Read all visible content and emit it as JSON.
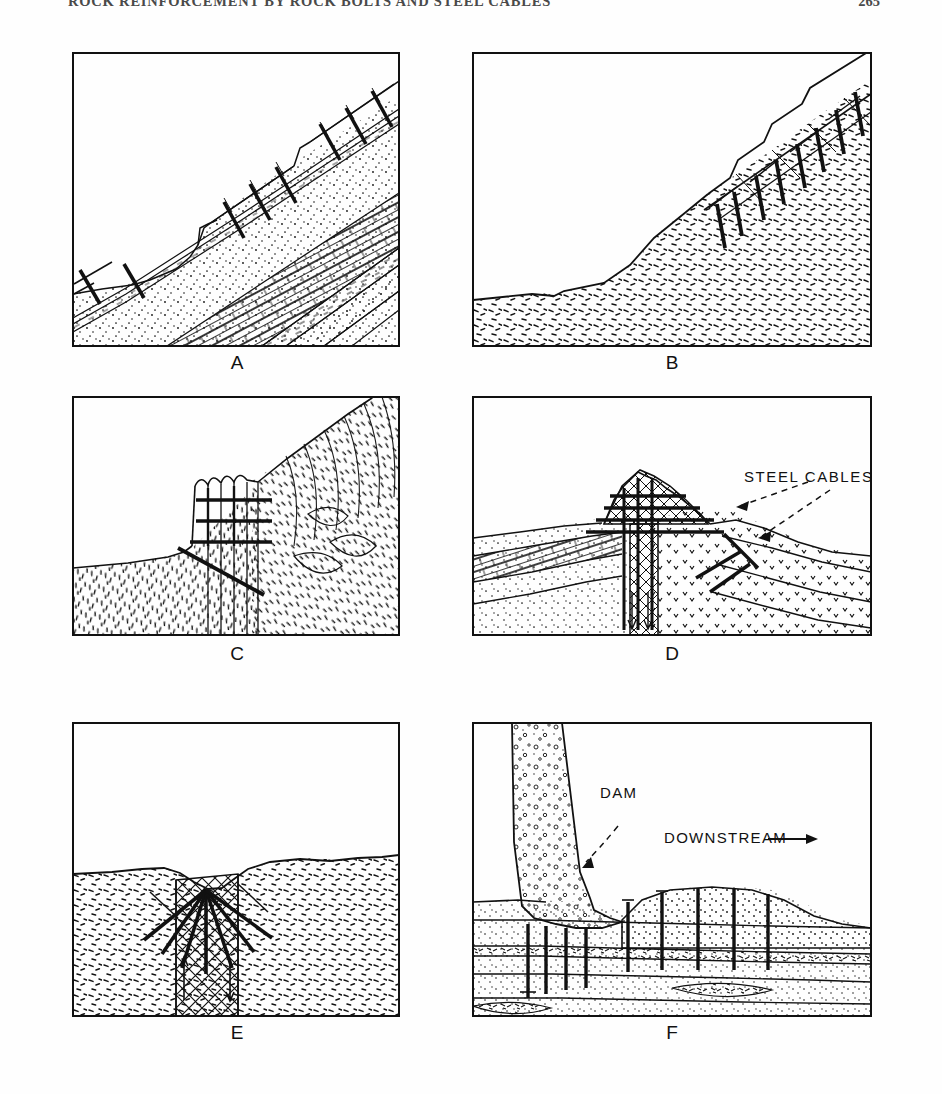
{
  "running_head": {
    "title": "ROCK REINFORCEMENT BY ROCK BOLTS AND STEEL CABLES",
    "page_number": "265"
  },
  "figure": {
    "panels": [
      {
        "id": "A",
        "label": "A",
        "description": "Bedded sedimentary slope (sandstone, limestone, shale) reinforced with rock bolts driven through a dipping bedding plane on a benched cut slope",
        "bolt_count": 11,
        "annotations": []
      },
      {
        "id": "B",
        "label": "B",
        "description": "Jointed rock mass slope with planar sliding surface stabilized by a row of rock bolts crossing the failure plane",
        "bolt_count": 8,
        "annotations": []
      },
      {
        "id": "C",
        "label": "C",
        "description": "Columnar jointed rock cliff restrained by horizontal steel cables and an inclined tensioned anchor",
        "bolt_count": 4,
        "annotations": []
      },
      {
        "id": "D",
        "label": "D",
        "description": "Rock pinnacle / outcrop over faulted strata laced with horizontal and vertical steel cables and inclined anchors",
        "bolt_count": 0,
        "annotations": [
          {
            "text": "STEEL CABLES",
            "leader_count": 2,
            "leader_style": "dashed-arrow"
          }
        ]
      },
      {
        "id": "E",
        "label": "E",
        "description": "Vertical shear / fault zone beneath a surface depression, reinforced by a fan of radiating bolts; arrows indicate relative block displacement",
        "bolt_count": 7,
        "annotations": []
      },
      {
        "id": "F",
        "label": "F",
        "description": "Concrete gravity dam founded on layered rock with weak seam; vertical anchor bolts tie the dam and downstream apron into deeper competent rock",
        "bolt_count": 9,
        "annotations": [
          {
            "text": "DAM",
            "leader_count": 1,
            "leader_style": "dashed-arrow"
          },
          {
            "text": "DOWNSTREAM",
            "leader_count": 0,
            "leader_style": "solid-arrow-right"
          }
        ]
      }
    ]
  },
  "colors": {
    "ink": "#111111",
    "paper": "#fefefe",
    "runhead": "#4a4a4a"
  }
}
